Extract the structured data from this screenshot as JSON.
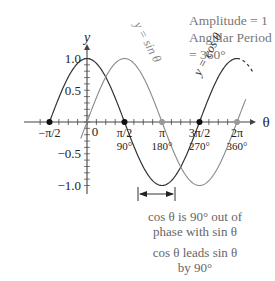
{
  "info": {
    "amplitude": "Amplitude = 1",
    "period": "Angular Period = 360°"
  },
  "notes": {
    "phase_line1": "cos θ is 90° out of",
    "phase_line2": "phase with sin θ",
    "lead_line1": "cos θ leads sin θ",
    "lead_line2": "by 90°"
  },
  "colors": {
    "cos": "#333333",
    "sin": "#8a8a8a",
    "axis": "#444444",
    "text": "#222222",
    "note": "#666666"
  },
  "chart_data": {
    "type": "line",
    "title": "",
    "xlabel": "θ",
    "ylabel": "y",
    "xlim_rad": [
      -1.5708,
      6.2832
    ],
    "ylim": [
      -1.0,
      1.0
    ],
    "grid": false,
    "y_ticks": [
      {
        "value": 1.0,
        "label": "1.0"
      },
      {
        "value": 0.5,
        "label": "0.5"
      },
      {
        "value": -0.5,
        "label": "−0.5"
      },
      {
        "value": -1.0,
        "label": "−1.0"
      }
    ],
    "x_ticks": [
      {
        "value": -1.5708,
        "label": "−π/2",
        "deg": ""
      },
      {
        "value": 0,
        "label": "0",
        "deg": ""
      },
      {
        "value": 1.5708,
        "label": "π/2",
        "deg": "90°"
      },
      {
        "value": 3.1416,
        "label": "π",
        "deg": "180°"
      },
      {
        "value": 4.7124,
        "label": "3π/2",
        "deg": "270°"
      },
      {
        "value": 6.2832,
        "label": "2π",
        "deg": "360°"
      }
    ],
    "series": [
      {
        "name": "y = cos θ",
        "function": "cos",
        "x_deg": [
          -90,
          0,
          90,
          180,
          270,
          360
        ],
        "values": [
          0,
          1,
          0,
          -1,
          0,
          1
        ],
        "dashed_extension_deg": [
          360,
          400
        ]
      },
      {
        "name": "y = sin θ",
        "function": "sin",
        "x_deg": [
          -15,
          0,
          90,
          180,
          270,
          360
        ],
        "values": [
          -0.26,
          0,
          1,
          0,
          -1,
          0
        ]
      }
    ],
    "marked_points": [
      {
        "x_label": "−π/2",
        "series": "y = cos θ",
        "y": 0
      },
      {
        "x_label": "π/2",
        "series": "y = cos θ",
        "y": 0
      },
      {
        "x_label": "3π/2",
        "series": "y = cos θ",
        "y": 0
      },
      {
        "x_label": "π",
        "series": "y = sin θ",
        "y": 0
      },
      {
        "x_label": "2π",
        "series": "y = sin θ",
        "y": 0
      }
    ],
    "annotations": [
      {
        "type": "double-arrow",
        "from_deg": 180,
        "to_deg": 270,
        "y": -1.0,
        "text": "cos θ is 90° out of phase with sin θ"
      },
      {
        "text": "cos θ leads sin θ by 90°"
      },
      {
        "text": "Amplitude = 1"
      },
      {
        "text": "Angular Period = 360°"
      }
    ]
  }
}
